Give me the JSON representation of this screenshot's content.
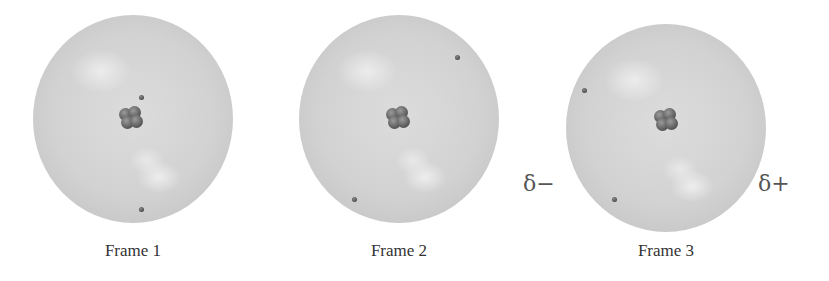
{
  "frames": [
    {
      "label": "Frame 1"
    },
    {
      "label": "Frame 2"
    },
    {
      "label": "Frame 3"
    }
  ],
  "charges": {
    "negative": "δ−",
    "positive": "δ+"
  },
  "colors": {
    "electron_cloud": "#d2d2d2",
    "nucleus": "#555555",
    "electron": "#555555",
    "text": "#333333"
  }
}
